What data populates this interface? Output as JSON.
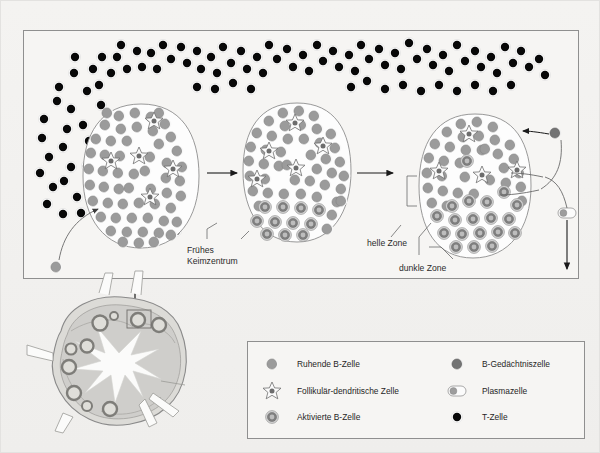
{
  "figure": {
    "title_visible": false,
    "background_color": "#f2f1ef",
    "panel_border_color": "#9b9b9b"
  },
  "main_panel": {
    "name": "germinal-center-development-panel",
    "x": 22,
    "y": 29,
    "width": 556,
    "height": 249
  },
  "annotations": [
    {
      "id": "fruehes-keimzentrum",
      "text_line1": "Frühes",
      "text_line2": "Keimzentrum",
      "x": 186,
      "y": 252
    },
    {
      "id": "helle-zone",
      "text": "helle Zone",
      "x": 366,
      "y": 245
    },
    {
      "id": "dunkle-zone",
      "text": "dunkle Zone",
      "x": 398,
      "y": 267
    }
  ],
  "follicles": [
    {
      "id": "follicle-naive",
      "label": "Primärfollikel",
      "cx": 140,
      "cy": 175,
      "rx": 58,
      "ry": 72
    },
    {
      "id": "follicle-early-gc",
      "label": "Frühes Keimzentrum",
      "cx": 296,
      "cy": 170,
      "rx": 52,
      "ry": 68
    },
    {
      "id": "follicle-mature-gc",
      "label": "Keimzentrum mit heller und dunkler Zone",
      "cx": 474,
      "cy": 185,
      "rx": 54,
      "ry": 72
    }
  ],
  "cell_types": {
    "resting_b_cell": {
      "name": "Ruhende B-Zelle",
      "fill": "#9a9a9a",
      "highlight": "#ffffff"
    },
    "fdc": {
      "name": "Follikulär-dendritische Zelle",
      "fill": "#6f6f6f",
      "outline": "#6a6a6a"
    },
    "activated_b_cell": {
      "name": "Aktivierte B-Zelle",
      "ring_outer": "#c9c9c9",
      "ring_mid": "#7d7d7d",
      "core": "#b5b5b5"
    },
    "memory_b_cell": {
      "name": "B-Gedächtniszelle",
      "fill": "#767676"
    },
    "plasma_cell": {
      "name": "Plasmazelle",
      "fill": "#9a9a9a",
      "body": "#ffffff"
    },
    "t_cell": {
      "name": "T-Zelle",
      "fill": "#000000",
      "outline": "#ffffff"
    }
  },
  "legend": {
    "box": {
      "x": 246,
      "y": 340,
      "width": 338,
      "height": 98
    },
    "left_column": [
      {
        "icon": "resting-b-cell-icon",
        "label": "Ruhende B-Zelle"
      },
      {
        "icon": "follicular-dendritic-cell-icon",
        "label": "Follikulär-dendritische Zelle"
      },
      {
        "icon": "activated-b-cell-icon",
        "label": "Aktivierte B-Zelle"
      }
    ],
    "right_column": [
      {
        "icon": "memory-b-cell-icon",
        "label": "B-Gedächtniszelle"
      },
      {
        "icon": "plasma-cell-icon",
        "label": "Plasmazelle"
      },
      {
        "icon": "t-cell-icon",
        "label": "T-Zelle"
      }
    ]
  },
  "lymph_node": {
    "name": "lymph-node-cross-section",
    "cx": 118,
    "cy": 362,
    "highlight_box": {
      "x": 96,
      "y": 308,
      "width": 24,
      "height": 17
    },
    "capsule_fill": "#dcdbd7",
    "cortex_fill": "#c6c5c1",
    "follicle_ring": "#8e8d89"
  },
  "flow": {
    "arrow_1": {
      "from": "follicle-naive",
      "to": "follicle-early-gc",
      "x1": 206,
      "x2": 238,
      "y": 172
    },
    "arrow_2": {
      "from": "follicle-early-gc",
      "to": "follicle-mature-gc",
      "x1": 354,
      "x2": 392,
      "y": 172
    },
    "memory_exit": {
      "label": "B-Gedächtniszelle",
      "recirculates": true
    },
    "plasma_exit": {
      "label": "Plasmazelle",
      "direction": "down"
    }
  }
}
